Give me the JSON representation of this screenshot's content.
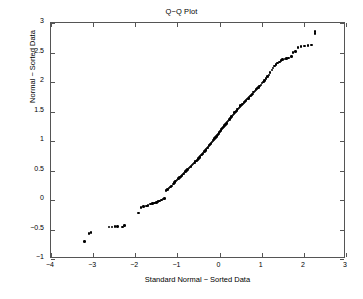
{
  "chart_data": {
    "type": "scatter",
    "title": "Q−Q Plot",
    "xlabel": "Standard Normal − Sorted Data",
    "ylabel": "Normal − Sorted Data",
    "xlim": [
      -4,
      3
    ],
    "ylim": [
      -1,
      3
    ],
    "xticks": [
      -4,
      -3,
      -2,
      -1,
      0,
      1,
      2,
      3
    ],
    "xticklabels": [
      "−4",
      "−3",
      "−2",
      "−1",
      "0",
      "1",
      "2",
      "3"
    ],
    "yticks": [
      -1,
      -0.5,
      0,
      0.5,
      1,
      1.5,
      2,
      2.5,
      3
    ],
    "yticklabels": [
      "−1",
      "−0.5",
      "0",
      "0.5",
      "1",
      "1.5",
      "2",
      "2.5",
      "3"
    ],
    "grid": false,
    "legend": null,
    "marker": "filled-circle",
    "marker_color": "#000000",
    "series": [
      {
        "name": "Q-Q sample quantiles",
        "x": [
          -3.2,
          -3.1,
          -3.05,
          -2.62,
          -2.55,
          -2.48,
          -2.42,
          -2.3,
          -2.26,
          -1.93,
          -1.86,
          -1.8,
          -1.74,
          -1.7,
          -1.64,
          -1.59,
          -1.55,
          -1.5,
          -1.46,
          -1.42,
          -1.38,
          -1.34,
          -1.3,
          -1.27,
          -1.24,
          -1.2,
          -1.17,
          -1.14,
          -1.1,
          -1.07,
          -1.04,
          -1.01,
          -0.98,
          -0.95,
          -0.92,
          -0.89,
          -0.86,
          -0.84,
          -0.81,
          -0.78,
          -0.76,
          -0.73,
          -0.7,
          -0.68,
          -0.65,
          -0.63,
          -0.6,
          -0.58,
          -0.55,
          -0.53,
          -0.5,
          -0.48,
          -0.46,
          -0.43,
          -0.41,
          -0.39,
          -0.36,
          -0.34,
          -0.32,
          -0.29,
          -0.27,
          -0.25,
          -0.23,
          -0.2,
          -0.18,
          -0.16,
          -0.14,
          -0.12,
          -0.09,
          -0.07,
          -0.05,
          -0.03,
          -0.01,
          0.01,
          0.03,
          0.05,
          0.07,
          0.09,
          0.12,
          0.14,
          0.16,
          0.18,
          0.2,
          0.23,
          0.25,
          0.27,
          0.29,
          0.32,
          0.34,
          0.36,
          0.39,
          0.41,
          0.43,
          0.46,
          0.48,
          0.5,
          0.53,
          0.55,
          0.58,
          0.6,
          0.63,
          0.65,
          0.68,
          0.7,
          0.73,
          0.76,
          0.78,
          0.81,
          0.84,
          0.86,
          0.89,
          0.92,
          0.95,
          0.98,
          1.01,
          1.04,
          1.07,
          1.1,
          1.14,
          1.17,
          1.2,
          1.24,
          1.27,
          1.3,
          1.34,
          1.38,
          1.42,
          1.46,
          1.5,
          1.55,
          1.59,
          1.64,
          1.7,
          1.74,
          1.8,
          1.86,
          1.93,
          2.02,
          2.1,
          2.18,
          2.26,
          2.26
        ],
        "y": [
          -0.7,
          -0.57,
          -0.55,
          -0.46,
          -0.46,
          -0.45,
          -0.45,
          -0.46,
          -0.43,
          -0.22,
          -0.13,
          -0.11,
          -0.1,
          -0.09,
          -0.07,
          -0.06,
          -0.05,
          -0.04,
          -0.03,
          -0.02,
          0.0,
          0.02,
          0.03,
          0.16,
          0.18,
          0.2,
          0.22,
          0.24,
          0.27,
          0.3,
          0.32,
          0.34,
          0.36,
          0.38,
          0.4,
          0.42,
          0.44,
          0.46,
          0.48,
          0.5,
          0.52,
          0.54,
          0.56,
          0.57,
          0.59,
          0.61,
          0.63,
          0.65,
          0.66,
          0.68,
          0.7,
          0.72,
          0.74,
          0.76,
          0.78,
          0.8,
          0.82,
          0.84,
          0.86,
          0.88,
          0.9,
          0.92,
          0.94,
          0.96,
          0.98,
          1.0,
          1.02,
          1.04,
          1.06,
          1.08,
          1.1,
          1.12,
          1.14,
          1.16,
          1.18,
          1.2,
          1.22,
          1.24,
          1.26,
          1.28,
          1.3,
          1.32,
          1.34,
          1.36,
          1.38,
          1.4,
          1.42,
          1.44,
          1.46,
          1.48,
          1.5,
          1.52,
          1.54,
          1.56,
          1.58,
          1.6,
          1.61,
          1.63,
          1.65,
          1.67,
          1.69,
          1.71,
          1.72,
          1.74,
          1.76,
          1.78,
          1.8,
          1.83,
          1.85,
          1.87,
          1.89,
          1.91,
          1.93,
          1.95,
          1.98,
          2.0,
          2.03,
          2.06,
          2.09,
          2.12,
          2.16,
          2.2,
          2.24,
          2.27,
          2.3,
          2.32,
          2.34,
          2.36,
          2.38,
          2.39,
          2.4,
          2.41,
          2.43,
          2.5,
          2.52,
          2.58,
          2.6,
          2.61,
          2.62,
          2.63,
          2.82,
          2.86
        ]
      }
    ]
  }
}
